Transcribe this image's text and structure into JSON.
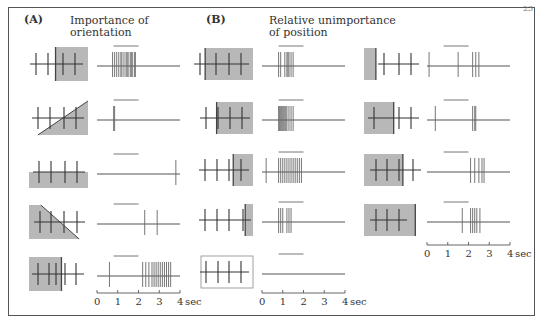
{
  "figure": {
    "page_number": "23",
    "panel_a": {
      "label": "(A)",
      "title_line1": "Importance of",
      "title_line2": "orientation"
    },
    "panel_b": {
      "label": "(B)",
      "title_line1": "Relative unimportance",
      "title_line2": "of position"
    },
    "time_axis": {
      "ticks": [
        "0",
        "1",
        "2",
        "3",
        "4"
      ],
      "unit": "sec"
    },
    "colors": {
      "shade": "#b8b8b8",
      "line": "#555555",
      "spike": "#666666"
    }
  },
  "chart_data": {
    "type": "raster",
    "xlabel": "sec",
    "xlim": [
      0,
      4
    ],
    "stimulus_bar": [
      0.8,
      2.0
    ],
    "panels": [
      {
        "name": "A - Importance of orientation",
        "rows": [
          {
            "stimulus": "shade right half (vertical edge)",
            "spikes": [
              0.75,
              0.85,
              0.95,
              1.05,
              1.15,
              1.2,
              1.3,
              1.4,
              1.45,
              1.5,
              1.6,
              1.65,
              1.7,
              1.8,
              1.85
            ]
          },
          {
            "stimulus": "shade lower-right triangle (diagonal edge)",
            "spikes": [
              0.8,
              0.85
            ]
          },
          {
            "stimulus": "shade lower half (horizontal edge)",
            "spikes": [
              3.8
            ]
          },
          {
            "stimulus": "shade lower-left triangle (diagonal edge, reversed)",
            "spikes": [
              2.3,
              2.9
            ]
          },
          {
            "stimulus": "shade left half",
            "spikes": [
              0.6,
              2.2,
              2.35,
              2.5,
              2.65,
              2.75,
              2.85,
              2.95,
              3.05,
              3.15,
              3.25,
              3.35,
              3.45,
              3.55
            ]
          }
        ]
      },
      {
        "name": "B - Relative unimportance of position (middle column)",
        "rows": [
          {
            "stimulus": "shade all, edge at far left",
            "spikes": [
              0.8,
              0.9,
              1.1,
              1.2,
              1.25,
              1.3,
              1.4,
              1.5
            ]
          },
          {
            "stimulus": "edge at left-center",
            "spikes": [
              0.8,
              0.85,
              0.9,
              0.95,
              1.0,
              1.05,
              1.1,
              1.15,
              1.2,
              1.3,
              1.4,
              1.5
            ]
          },
          {
            "stimulus": "edge at center",
            "spikes": [
              0.2,
              0.8,
              0.9,
              1.0,
              1.1,
              1.2,
              1.3,
              1.4,
              1.5,
              1.6,
              1.7,
              1.8,
              1.9
            ]
          },
          {
            "stimulus": "edge at far right",
            "spikes": [
              0.8,
              0.9,
              1.0,
              1.2,
              1.3,
              1.4
            ]
          },
          {
            "stimulus": "no shading (uniform)",
            "spikes": []
          }
        ]
      },
      {
        "name": "B - Relative unimportance of position (right column)",
        "rows": [
          {
            "stimulus": "narrow shade at far left",
            "spikes": [
              0.1,
              1.5,
              2.2,
              2.35,
              2.5
            ]
          },
          {
            "stimulus": "shade left third",
            "spikes": [
              0.4,
              2.2,
              2.3,
              2.35
            ]
          },
          {
            "stimulus": "shade left two-thirds",
            "spikes": [
              2.1,
              2.3,
              2.5,
              2.65,
              2.75
            ]
          },
          {
            "stimulus": "shade nearly all",
            "spikes": [
              1.7,
              2.1,
              2.2,
              2.3,
              2.4,
              2.55
            ]
          }
        ]
      }
    ]
  }
}
